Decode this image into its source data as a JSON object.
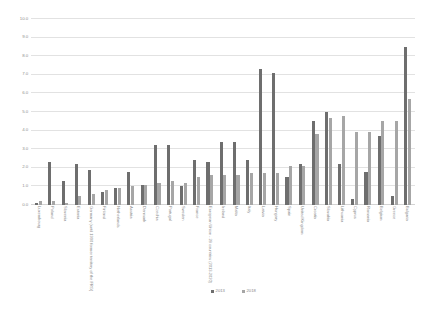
{
  "chart_data": {
    "type": "bar",
    "title": "",
    "subtitle": "",
    "xlabel": "",
    "ylabel": "",
    "ylim": [
      0.0,
      10.0
    ],
    "yticks": [
      "0.0",
      "1.0",
      "2.0",
      "3.0",
      "4.0",
      "5.0",
      "6.0",
      "7.0",
      "8.0",
      "9.0",
      "10.0"
    ],
    "grid": true,
    "legend_position": "bottom",
    "categories": [
      "Luxembourg",
      "Poland",
      "Slovenia",
      "Estonia",
      "Germany (until 1990 former territory of the FRG)",
      "Finland",
      "Netherlands",
      "Austria",
      "Denmark",
      "Czechia",
      "Portugal",
      "Sweden",
      "France",
      "European Union - 28 countries (2013-2020)",
      "Ireland",
      "Malta",
      "Italy",
      "Latvia",
      "Hungary",
      "Spain",
      "United Kingdom",
      "Croatia",
      "Slovakia",
      "Lithuania",
      "Cyprus",
      "Romania",
      "Belgium",
      "Greece",
      "Bulgaria"
    ],
    "series": [
      {
        "name": "2013",
        "color": "#6e6e6e",
        "values": [
          0.1,
          2.3,
          1.3,
          2.2,
          1.9,
          0.7,
          0.9,
          1.8,
          1.1,
          3.2,
          3.2,
          1.0,
          2.4,
          2.3,
          3.4,
          3.4,
          2.4,
          7.3,
          7.1,
          1.5,
          2.2,
          4.5,
          5.0,
          2.2,
          0.3,
          1.8,
          3.7,
          0.5,
          8.5
        ]
      },
      {
        "name": "2018",
        "color": "#a6a6a6",
        "values": [
          0.2,
          0.2,
          0.1,
          0.5,
          0.6,
          0.8,
          0.9,
          1.0,
          1.1,
          1.2,
          1.3,
          1.2,
          1.5,
          1.6,
          1.6,
          1.6,
          1.7,
          1.7,
          1.7,
          2.1,
          2.1,
          3.8,
          4.7,
          4.8,
          3.9,
          3.9,
          4.5,
          4.5,
          5.7
        ]
      }
    ]
  },
  "legend": {
    "items": [
      {
        "label": "2013"
      },
      {
        "label": "2018"
      }
    ]
  }
}
